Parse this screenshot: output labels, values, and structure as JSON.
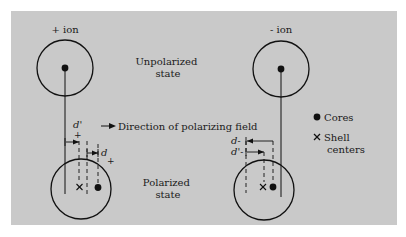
{
  "figure": {
    "panel_color": "#c9c9c9",
    "ink_color": "#111111",
    "positive_ion": {
      "label": "+ ion"
    },
    "negative_ion": {
      "label": "- ion"
    },
    "states": {
      "unpolarized": [
        "Unpolarized",
        "state"
      ],
      "polarized": [
        "Polarized",
        "state"
      ]
    },
    "field": {
      "label": "Direction of polarizing field"
    },
    "displacements": {
      "positive_shell": {
        "symbol": "d'",
        "subscript": "+"
      },
      "positive_core": {
        "symbol": "d",
        "subscript": "+"
      },
      "negative_core": {
        "symbol": "d",
        "subscript": "-"
      },
      "negative_shell": {
        "symbol": "d'",
        "subscript": "-"
      }
    },
    "legend": {
      "items": [
        {
          "marker": "core-dot",
          "lines": [
            "Cores"
          ]
        },
        {
          "marker": "shell-x",
          "lines": [
            "Shell",
            "centers"
          ]
        }
      ]
    }
  }
}
